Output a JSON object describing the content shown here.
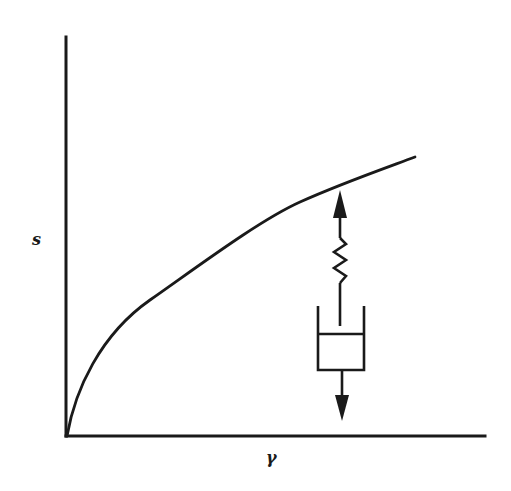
{
  "figure": {
    "type": "stress-strain diagram with viscoelastic element",
    "axes": {
      "y_label": "s",
      "x_label": "γ"
    },
    "curve": {
      "shape": "concave-down monotonic increasing (power-law, sqrt-like) from origin"
    },
    "mechanical_element": {
      "components": [
        "upward arrow",
        "spring",
        "dashpot",
        "downward arrow"
      ],
      "arrangement": "spring in series with dashpot (Maxwell element)"
    },
    "colors": {
      "ink": "#1a1a1a",
      "background": "#ffffff"
    }
  }
}
